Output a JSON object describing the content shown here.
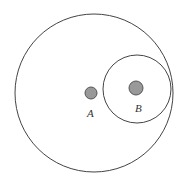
{
  "diagram": {
    "title": "",
    "colors": {
      "stroke": "#444444",
      "dot_fill": "#999999",
      "background": "#ffffff"
    },
    "large_circle": {
      "cx": 94,
      "cy": 93,
      "r": 79
    },
    "small_circle": {
      "cx": 137,
      "cy": 89,
      "r": 34
    },
    "points": [
      {
        "name": "A",
        "label": "A",
        "cx": 91,
        "cy": 93,
        "r": 6,
        "label_x": 87,
        "label_y": 117
      },
      {
        "name": "B",
        "label": "B",
        "cx": 136,
        "cy": 88,
        "r": 7,
        "label_x": 135,
        "label_y": 112
      }
    ]
  }
}
